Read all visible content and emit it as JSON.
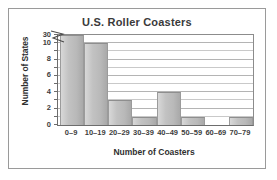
{
  "figure": {
    "frame_color": "#9a9a9a",
    "background": "#ffffff"
  },
  "chart_data": {
    "type": "bar",
    "title": "U.S. Roller Coasters",
    "xlabel": "Number of Coasters",
    "ylabel": "Number of States",
    "categories": [
      "0–9",
      "10–19",
      "20–29",
      "30–39",
      "40–49",
      "50–59",
      "60–69",
      "70–79"
    ],
    "values": [
      30,
      10,
      3,
      1,
      4,
      1,
      0,
      1
    ],
    "ytick_labels": [
      "0",
      "2",
      "4",
      "6",
      "8",
      "10",
      "30"
    ],
    "ytick_values": [
      0,
      2,
      4,
      6,
      8,
      10,
      30
    ],
    "ylim": [
      0,
      30
    ],
    "axis_break": {
      "present": true,
      "between": [
        10,
        30
      ],
      "symbol": "zigzag"
    },
    "grid": "horizontal",
    "grid_interval": 1,
    "legend": "none",
    "bar_color": "#c2c2c2",
    "title_color": "#3a3a3a"
  }
}
